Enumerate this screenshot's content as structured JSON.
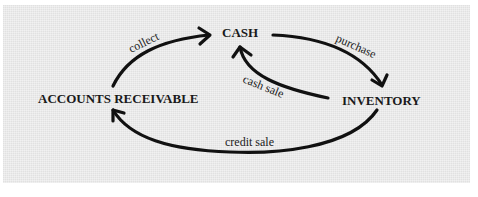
{
  "diagram": {
    "type": "cycle",
    "nodes": {
      "cash": "CASH",
      "inventory": "INVENTORY",
      "accounts_receivable": "ACCOUNTS RECEIVABLE"
    },
    "edges": {
      "collect": "collect",
      "purchase": "purchase",
      "cash_sale": "cash sale",
      "credit_sale": "credit sale"
    },
    "flows": [
      {
        "from": "ACCOUNTS RECEIVABLE",
        "to": "CASH",
        "label": "collect"
      },
      {
        "from": "CASH",
        "to": "INVENTORY",
        "label": "purchase"
      },
      {
        "from": "INVENTORY",
        "to": "CASH",
        "label": "cash sale"
      },
      {
        "from": "INVENTORY",
        "to": "ACCOUNTS RECEIVABLE",
        "label": "credit sale"
      }
    ],
    "colors": {
      "background": "#eaeaea",
      "ink": "#111111"
    }
  }
}
